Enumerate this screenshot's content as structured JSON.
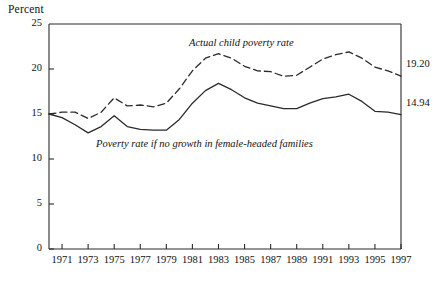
{
  "figure": {
    "y_axis_title": "Percent"
  },
  "chart_data": {
    "type": "line",
    "title": "",
    "subtitle": "",
    "xlabel": "",
    "ylabel": "Percent",
    "xlim": [
      1970,
      1997
    ],
    "ylim": [
      0,
      25
    ],
    "ytick_values": [
      0,
      5,
      10,
      15,
      20,
      25
    ],
    "ytick_labels": [
      "0",
      "5",
      "10",
      "15",
      "20",
      "25"
    ],
    "xtick_values": [
      1971,
      1973,
      1975,
      1977,
      1979,
      1981,
      1983,
      1985,
      1987,
      1989,
      1991,
      1993,
      1995,
      1997
    ],
    "xtick_labels": [
      "1971",
      "1973",
      "1975",
      "1977",
      "1979",
      "1981",
      "1983",
      "1985",
      "1987",
      "1989",
      "1991",
      "1993",
      "1995",
      "1997"
    ],
    "grid": false,
    "legend_position": "inline-annotations",
    "x": [
      1970,
      1971,
      1972,
      1973,
      1974,
      1975,
      1976,
      1977,
      1978,
      1979,
      1980,
      1981,
      1982,
      1983,
      1984,
      1985,
      1986,
      1987,
      1988,
      1989,
      1990,
      1991,
      1992,
      1993,
      1994,
      1995,
      1996,
      1997
    ],
    "series": [
      {
        "name": "Actual child poverty rate",
        "style": "dashed",
        "color": "#2b2b2b",
        "end_value_label": "19.20",
        "values": [
          15.0,
          15.2,
          15.2,
          14.5,
          15.2,
          16.8,
          15.9,
          16.0,
          15.8,
          16.2,
          17.8,
          19.8,
          21.2,
          21.7,
          21.2,
          20.3,
          19.8,
          19.7,
          19.2,
          19.3,
          20.2,
          21.1,
          21.6,
          21.9,
          21.2,
          20.2,
          19.8,
          19.2
        ]
      },
      {
        "name": "Poverty rate if no growth in female-headed families",
        "style": "solid",
        "color": "#2b2b2b",
        "end_value_label": "14.94",
        "values": [
          15.0,
          14.6,
          13.8,
          12.9,
          13.6,
          14.8,
          13.6,
          13.3,
          13.2,
          13.2,
          14.4,
          16.2,
          17.6,
          18.4,
          17.7,
          16.8,
          16.2,
          15.9,
          15.6,
          15.6,
          16.2,
          16.7,
          16.9,
          17.2,
          16.4,
          15.3,
          15.2,
          14.94
        ]
      }
    ],
    "annotations": [
      {
        "text": "Actual child poverty rate",
        "style": "italic",
        "x_px": 189,
        "y_px": 37
      },
      {
        "text": "Poverty rate if no growth in female-headed families",
        "style": "italic",
        "x_px": 96,
        "y_px": 138
      }
    ]
  }
}
